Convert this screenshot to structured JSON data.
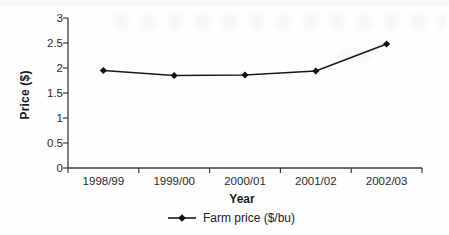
{
  "chart_data": {
    "type": "line",
    "title": "",
    "xlabel": "Year",
    "ylabel": "Price ($)",
    "categories": [
      "1998/99",
      "1999/00",
      "2000/01",
      "2001/02",
      "2002/03"
    ],
    "series": [
      {
        "name": "Farm price ($/bu)",
        "values": [
          1.95,
          1.85,
          1.86,
          1.94,
          2.48
        ]
      }
    ],
    "ylim": [
      0,
      3
    ],
    "yticks": [
      "0",
      "0.5",
      "1",
      "1.5",
      "2",
      "2.5",
      "3"
    ],
    "ytick_values": [
      0,
      0.5,
      1,
      1.5,
      2,
      2.5,
      3
    ],
    "grid": false,
    "legend_position": "bottom",
    "marker": "diamond",
    "colors": {
      "line": "#1a1a1a",
      "marker": "#111111",
      "axis": "#3c3c3c",
      "tick_text": "#2a2a2a",
      "title_text": "#1c1c1c"
    }
  }
}
